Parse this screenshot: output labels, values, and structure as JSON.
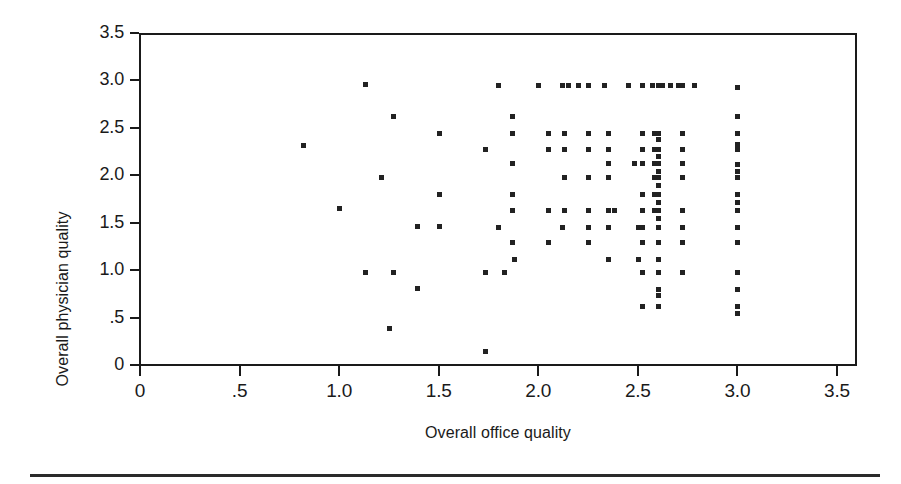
{
  "chart_data": {
    "type": "scatter",
    "title": "",
    "xlabel": "Overall office quality",
    "ylabel": "Overall physician quality",
    "xlim": [
      0,
      3.5
    ],
    "ylim": [
      0,
      3.5
    ],
    "xticks": [
      "0",
      ".5",
      "1.0",
      "1.5",
      "2.0",
      "2.5",
      "3.0",
      "3.5"
    ],
    "xtick_values": [
      0,
      0.5,
      1.0,
      1.5,
      2.0,
      2.5,
      3.0,
      3.5
    ],
    "yticks": [
      "0",
      ".5",
      "1.0",
      "1.5",
      "2.0",
      "2.5",
      "3.0",
      "3.5"
    ],
    "ytick_values": [
      0,
      0.5,
      1.0,
      1.5,
      2.0,
      2.5,
      3.0,
      3.5
    ],
    "grid": false,
    "legend": null,
    "marker": "filled-square",
    "marker_color": "#222222",
    "marker_size_px": 5,
    "points": [
      [
        0.82,
        2.32
      ],
      [
        1.0,
        1.65
      ],
      [
        1.13,
        2.96
      ],
      [
        1.13,
        0.98
      ],
      [
        1.21,
        1.98
      ],
      [
        1.25,
        0.39
      ],
      [
        1.27,
        2.62
      ],
      [
        1.27,
        0.98
      ],
      [
        1.39,
        1.47
      ],
      [
        1.39,
        0.81
      ],
      [
        1.5,
        2.45
      ],
      [
        1.5,
        1.8
      ],
      [
        1.5,
        1.47
      ],
      [
        1.73,
        2.28
      ],
      [
        1.73,
        0.98
      ],
      [
        1.73,
        0.15
      ],
      [
        1.8,
        2.95
      ],
      [
        1.8,
        1.46
      ],
      [
        1.83,
        0.98
      ],
      [
        1.87,
        2.62
      ],
      [
        1.87,
        2.45
      ],
      [
        1.87,
        2.13
      ],
      [
        1.87,
        1.8
      ],
      [
        1.87,
        1.63
      ],
      [
        1.87,
        1.3
      ],
      [
        1.88,
        1.12
      ],
      [
        2.0,
        2.95
      ],
      [
        2.05,
        2.45
      ],
      [
        2.05,
        2.28
      ],
      [
        2.05,
        1.63
      ],
      [
        2.05,
        1.3
      ],
      [
        2.12,
        2.95
      ],
      [
        2.12,
        1.46
      ],
      [
        2.15,
        2.95
      ],
      [
        2.13,
        2.45
      ],
      [
        2.13,
        2.28
      ],
      [
        2.13,
        1.98
      ],
      [
        2.13,
        1.63
      ],
      [
        2.2,
        2.95
      ],
      [
        2.25,
        2.95
      ],
      [
        2.25,
        2.45
      ],
      [
        2.25,
        2.28
      ],
      [
        2.25,
        1.98
      ],
      [
        2.25,
        1.63
      ],
      [
        2.25,
        1.46
      ],
      [
        2.25,
        1.3
      ],
      [
        2.33,
        2.95
      ],
      [
        2.35,
        2.45
      ],
      [
        2.35,
        2.28
      ],
      [
        2.35,
        2.13
      ],
      [
        2.35,
        1.98
      ],
      [
        2.35,
        1.63
      ],
      [
        2.35,
        1.46
      ],
      [
        2.35,
        1.12
      ],
      [
        2.38,
        1.63
      ],
      [
        2.45,
        2.95
      ],
      [
        2.48,
        2.13
      ],
      [
        2.5,
        1.46
      ],
      [
        2.5,
        1.12
      ],
      [
        2.52,
        2.95
      ],
      [
        2.52,
        2.45
      ],
      [
        2.52,
        2.28
      ],
      [
        2.52,
        2.13
      ],
      [
        2.52,
        1.8
      ],
      [
        2.52,
        1.63
      ],
      [
        2.52,
        1.46
      ],
      [
        2.52,
        1.3
      ],
      [
        2.52,
        0.98
      ],
      [
        2.52,
        0.62
      ],
      [
        2.57,
        2.95
      ],
      [
        2.58,
        2.45
      ],
      [
        2.58,
        2.28
      ],
      [
        2.58,
        2.13
      ],
      [
        2.58,
        1.98
      ],
      [
        2.58,
        1.8
      ],
      [
        2.58,
        1.63
      ],
      [
        2.6,
        2.95
      ],
      [
        2.61,
        2.95
      ],
      [
        2.62,
        2.95
      ],
      [
        2.6,
        2.45
      ],
      [
        2.6,
        2.38
      ],
      [
        2.6,
        2.28
      ],
      [
        2.6,
        2.2
      ],
      [
        2.6,
        2.13
      ],
      [
        2.6,
        2.05
      ],
      [
        2.6,
        1.98
      ],
      [
        2.6,
        1.9
      ],
      [
        2.6,
        1.8
      ],
      [
        2.6,
        1.72
      ],
      [
        2.6,
        1.63
      ],
      [
        2.6,
        1.55
      ],
      [
        2.6,
        1.46
      ],
      [
        2.6,
        1.3
      ],
      [
        2.6,
        1.12
      ],
      [
        2.6,
        0.98
      ],
      [
        2.6,
        0.8
      ],
      [
        2.6,
        0.74
      ],
      [
        2.6,
        0.62
      ],
      [
        2.66,
        2.95
      ],
      [
        2.7,
        2.95
      ],
      [
        2.72,
        2.95
      ],
      [
        2.72,
        2.45
      ],
      [
        2.72,
        2.28
      ],
      [
        2.72,
        2.13
      ],
      [
        2.72,
        1.98
      ],
      [
        2.72,
        1.63
      ],
      [
        2.72,
        1.46
      ],
      [
        2.72,
        1.3
      ],
      [
        2.72,
        0.98
      ],
      [
        2.78,
        2.95
      ],
      [
        3.0,
        2.93
      ],
      [
        3.0,
        2.62
      ],
      [
        3.0,
        2.45
      ],
      [
        3.0,
        2.33
      ],
      [
        3.0,
        2.28
      ],
      [
        3.0,
        2.12
      ],
      [
        3.0,
        2.05
      ],
      [
        3.0,
        1.98
      ],
      [
        3.0,
        1.8
      ],
      [
        3.0,
        1.72
      ],
      [
        3.0,
        1.63
      ],
      [
        3.0,
        1.46
      ],
      [
        3.0,
        1.3
      ],
      [
        3.0,
        0.98
      ],
      [
        3.0,
        0.8
      ],
      [
        3.0,
        0.62
      ],
      [
        3.0,
        0.55
      ]
    ]
  },
  "figure": {
    "bottom_rule": true
  }
}
